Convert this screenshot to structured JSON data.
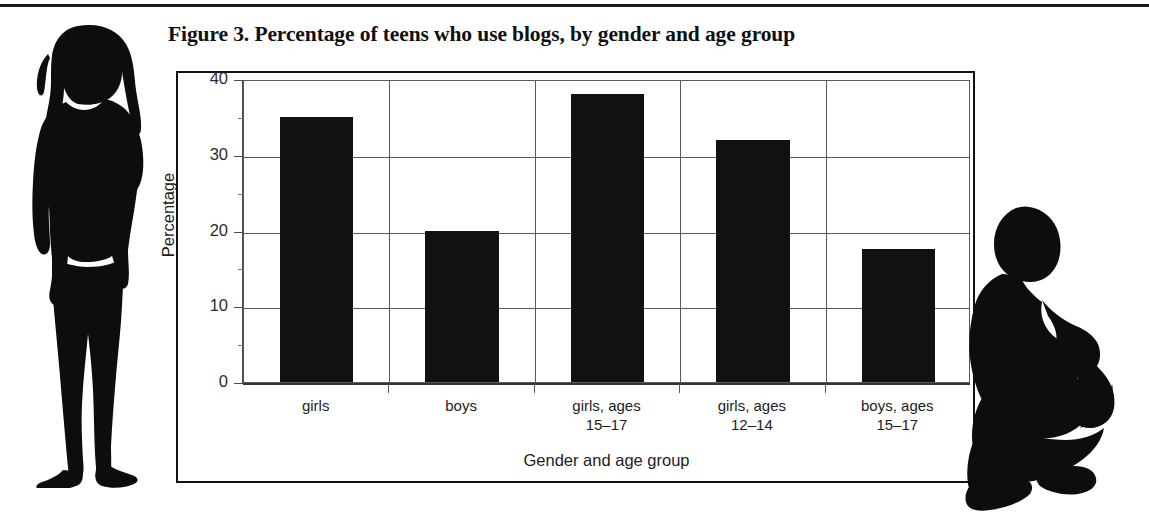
{
  "figure": {
    "title": "Figure 3. Percentage of teens who use blogs, by gender and age group"
  },
  "illustrations": {
    "left": "standing-teen-girl-silhouette",
    "right": "crouching-teen-boy-silhouette"
  },
  "colors": {
    "bar_fill": "#111111",
    "grid": "#5a5a5a",
    "frame": "#111111",
    "text": "#1d1d1d",
    "background": "#ffffff"
  },
  "chart_data": {
    "type": "bar",
    "title": "Figure 3. Percentage of teens who use blogs, by gender and age group",
    "xlabel": "Gender and age group",
    "ylabel": "Percentage",
    "categories": [
      "girls",
      "boys",
      "girls, ages\n15–17",
      "girls, ages\n12–14",
      "boys, ages\n15–17"
    ],
    "values": [
      35,
      20,
      38,
      32,
      17.5
    ],
    "ylim": [
      0,
      40
    ],
    "yticks": [
      0,
      10,
      20,
      30,
      40
    ],
    "ytick_labels": [
      "0",
      "10",
      "20",
      "30",
      "40"
    ],
    "yminor_step": 5,
    "grid": "horizontal-and-category-separators",
    "legend": "none",
    "bar_color": "#111111"
  }
}
